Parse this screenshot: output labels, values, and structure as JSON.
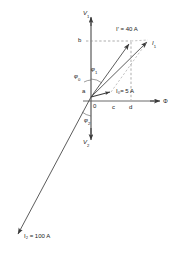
{
  "figure": {
    "type": "phasor-diagram",
    "background": "#ffffff",
    "line_color": "#3a3a3a",
    "dash_color": "#6e6e6e",
    "text_color": "#1a1a1a"
  },
  "axes": {
    "vertical_up": {
      "label": "V",
      "sub": "1",
      "name": "primary-voltage-axis"
    },
    "vertical_down": {
      "label": "V",
      "sub": "2",
      "name": "secondary-voltage-axis"
    },
    "horizontal_right": {
      "label": "Φ",
      "sub": "",
      "name": "flux-axis"
    }
  },
  "origin": {
    "label": "0"
  },
  "points": [
    {
      "id": "a",
      "label": "a",
      "x": 78,
      "y": 93
    },
    {
      "id": "b",
      "label": "b",
      "x": 81,
      "y": 38
    },
    {
      "id": "c",
      "label": "c",
      "x": 114,
      "y": 109
    },
    {
      "id": "d",
      "label": "d",
      "x": 133,
      "y": 109
    }
  ],
  "angles": [
    {
      "id": "phi0",
      "label": "φ",
      "sub": "0",
      "x": 77,
      "y": 74
    },
    {
      "id": "phi1",
      "label": "φ",
      "sub": "1",
      "x": 93,
      "y": 68
    },
    {
      "id": "phi2",
      "label": "φ",
      "sub": "2",
      "x": 86,
      "y": 119
    }
  ],
  "vectors": [
    {
      "id": "I1",
      "name": "current-i1-vector",
      "label": "I",
      "sub": "1",
      "value": "",
      "unit": "",
      "caption": "I₁",
      "tip_x": 150,
      "tip_y": 39
    },
    {
      "id": "Iprime",
      "name": "current-i-prime-vector",
      "label": "I'",
      "sub": "",
      "value": "40",
      "unit": "A",
      "caption": "I′ = 40 A",
      "tip_x": 131,
      "tip_y": 41
    },
    {
      "id": "I0",
      "name": "magnetizing-current-i0-vector",
      "label": "I",
      "sub": "0",
      "value": "5",
      "unit": "A",
      "caption": "I₀= 5 A",
      "tip_x": 113,
      "tip_y": 91
    },
    {
      "id": "I2",
      "name": "current-i2-vector",
      "label": "I",
      "sub": "2",
      "value": "100",
      "unit": "A",
      "caption": "I₂ = 100 A",
      "tip_x": 16,
      "tip_y": 236
    }
  ],
  "labels": {
    "v1": "V",
    "v1_sub": "1",
    "v2": "V",
    "v2_sub": "2",
    "phi_axis": "Φ",
    "origin": "0",
    "point_a": "a",
    "point_b": "b",
    "point_c": "c",
    "point_d": "d",
    "phi0": "φ",
    "phi0_sub": "0",
    "phi1": "φ",
    "phi1_sub": "1",
    "phi2": "φ",
    "phi2_sub": "2",
    "i1": "I",
    "i1_sub": "1",
    "i_prime_text": "I′ = 40 A",
    "i0_text": "I₀= 5 A",
    "i2_text": "I₂ = 100 A"
  }
}
